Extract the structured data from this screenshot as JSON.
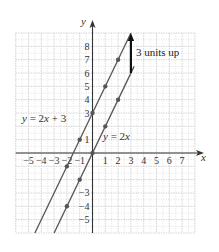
{
  "chart_data": {
    "type": "line",
    "title": "",
    "xlabel": "x",
    "ylabel": "y",
    "xlim": [
      -6,
      8
    ],
    "ylim": [
      -6,
      9
    ],
    "grid": true,
    "x_tick_labels": [
      "-5",
      "-4",
      "-3",
      "-2",
      "-1",
      "1",
      "2",
      "3",
      "4",
      "5",
      "6",
      "7"
    ],
    "x_ticks": [
      -5,
      -4,
      -3,
      -2,
      -1,
      1,
      2,
      3,
      4,
      5,
      6,
      7
    ],
    "y_tick_labels": [
      "8",
      "7",
      "6",
      "5",
      "4",
      "3",
      "1",
      "-3",
      "-4",
      "-5"
    ],
    "y_ticks": [
      8,
      7,
      6,
      5,
      4,
      3,
      1,
      -3,
      -4,
      -5
    ],
    "series": [
      {
        "name": "y = 2x + 3",
        "label": "y = 2x + 3",
        "slope": 2,
        "intercept": 3,
        "points": [
          [
            -2,
            -1
          ],
          [
            -1,
            1
          ],
          [
            0,
            3
          ],
          [
            1,
            5
          ],
          [
            2,
            7
          ]
        ],
        "line_extent": [
          [
            -4.5,
            -6
          ],
          [
            3,
            9
          ]
        ]
      },
      {
        "name": "y = 2x",
        "label": "y = 2x",
        "slope": 2,
        "intercept": 0,
        "points": [
          [
            -2,
            -4
          ],
          [
            -1,
            -2
          ],
          [
            0,
            0
          ],
          [
            1,
            2
          ],
          [
            2,
            4
          ]
        ],
        "line_extent": [
          [
            -3,
            -6
          ],
          [
            3.25,
            6.5
          ]
        ]
      }
    ],
    "annotations": [
      {
        "text": "3 units up",
        "arrow_from": [
          3,
          6
        ],
        "arrow_to": [
          3,
          9
        ]
      }
    ]
  },
  "colors": {
    "grid": "#c8c8c8",
    "axis": "#333333",
    "line": "#555555",
    "point": "#555555",
    "arrow": "#111111"
  }
}
